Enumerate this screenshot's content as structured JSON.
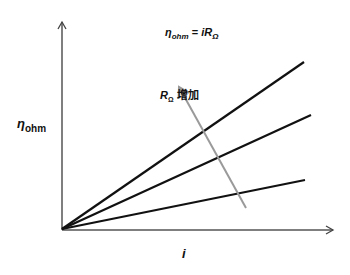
{
  "diagram": {
    "equation": {
      "lhs_symbol": "η",
      "lhs_sub": "ohm",
      "equals": " = ",
      "rhs_symbol": "iR",
      "rhs_sub": "Ω"
    },
    "y_axis_label": {
      "symbol": "η",
      "sub": "ohm"
    },
    "x_axis_label": "i",
    "arrow_label": {
      "symbol": "R",
      "sub": "Ω",
      "text": " 增加"
    },
    "colors": {
      "lines": "#111111",
      "axes": "#555555",
      "trend_arrow": "#9a9a9a"
    },
    "origin": [
      62,
      229
    ],
    "lines": [
      {
        "name": "line-high-resistance",
        "end": [
          304,
          62
        ]
      },
      {
        "name": "line-mid-resistance",
        "end": [
          311,
          115
        ]
      },
      {
        "name": "line-low-resistance",
        "end": [
          305,
          180
        ]
      }
    ],
    "trend_arrow": {
      "from": [
        246,
        208
      ],
      "to": [
        178,
        85
      ]
    }
  }
}
